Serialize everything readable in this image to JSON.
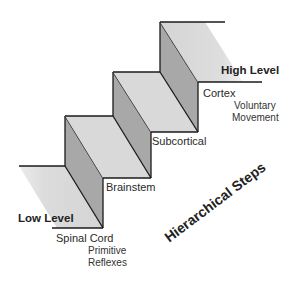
{
  "diagram": {
    "title": "Hierarchical Steps",
    "colors": {
      "tread": "#d9d9d9",
      "riser": "#a6a6a6",
      "line": "#1a1a1a",
      "text": "#2a2a2a"
    },
    "levels": {
      "high": "High Level",
      "low": "Low Level"
    },
    "steps": [
      {
        "name": "Spinal Cord",
        "note_line1": "Primitive",
        "note_line2": "Reflexes"
      },
      {
        "name": "Brainstem"
      },
      {
        "name": "Subcortical"
      },
      {
        "name": "Cortex",
        "note_line1": "Voluntary",
        "note_line2": "Movement"
      }
    ]
  }
}
